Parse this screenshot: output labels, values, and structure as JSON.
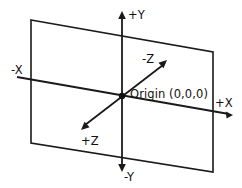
{
  "diagram": {
    "background_color": "#ffffff",
    "stroke_color": "#1a1a1a",
    "text_color": "#111111",
    "origin_label": "Origin (0,0,0)",
    "labels": {
      "y_positive": "+Y",
      "y_negative": "-Y",
      "x_positive": "+X",
      "x_negative": "-X",
      "z_positive": "+Z",
      "z_negative": "-Z"
    },
    "geometry": {
      "plane_points": "31,20 213,52 213,172 31,143",
      "y_axis": {
        "x1": 122,
        "y1": 16,
        "x2": 122,
        "y2": 167
      },
      "x_axis": {
        "x1": 17,
        "y1": 77,
        "x2": 229,
        "y2": 114
      },
      "z_axis": {
        "x1": 85,
        "y1": 125,
        "x2": 163,
        "y2": 65
      },
      "origin": {
        "cx": 122,
        "cy": 96,
        "r": 3.2
      },
      "arrow_y_positive": "122,11 118.2,19 125.8,19",
      "arrow_y_negative": "122,172 118.2,164 125.8,164",
      "arrow_x_positive": "233,115 225.6,111.6 226.6,118.6",
      "arrow_z_positive": "81,130 84.5,121.8 89.6,127.3",
      "arrow_z_negative": "167,60 163.5,68.2 158.4,62.7"
    },
    "label_positions": {
      "y_positive": {
        "x": 128,
        "y": 19
      },
      "y_negative": {
        "x": 124,
        "y": 181
      },
      "x_positive": {
        "x": 215,
        "y": 107
      },
      "x_negative": {
        "x": 11,
        "y": 74
      },
      "z_positive": {
        "x": 81,
        "y": 145
      },
      "z_negative": {
        "x": 142,
        "y": 63
      },
      "origin": {
        "x": 130,
        "y": 98
      }
    }
  }
}
